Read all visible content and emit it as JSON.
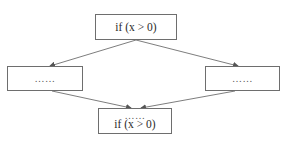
{
  "diagram": {
    "type": "flowchart",
    "colors": {
      "border": "#6e6e6e",
      "edge": "#6e6e6e",
      "text": "#2a2a2a",
      "background": "#ffffff"
    },
    "nodes": [
      {
        "id": "top",
        "lines": [
          "if (x > 0)"
        ]
      },
      {
        "id": "left",
        "lines": [
          "……"
        ]
      },
      {
        "id": "right",
        "lines": [
          "……"
        ]
      },
      {
        "id": "bottom",
        "lines": [
          "……",
          "if (x > 0)"
        ]
      }
    ],
    "edges": [
      {
        "from": "top",
        "to": "left"
      },
      {
        "from": "top",
        "to": "right"
      },
      {
        "from": "left",
        "to": "bottom"
      },
      {
        "from": "right",
        "to": "bottom"
      }
    ]
  }
}
